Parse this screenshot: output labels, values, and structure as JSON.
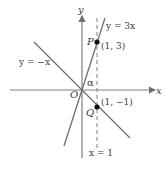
{
  "diagram": {
    "axes": {
      "x_label": "x",
      "y_label": "y",
      "origin_label": "O"
    },
    "lines": [
      {
        "name": "y=3x",
        "label": "y = 3x"
      },
      {
        "name": "y=-x",
        "label": "y = −x"
      },
      {
        "name": "x=1",
        "label": "x = 1",
        "style": "dashed"
      }
    ],
    "points": [
      {
        "name": "P",
        "label": "P",
        "coords": "(1, 3)"
      },
      {
        "name": "Q",
        "label": "Q",
        "coords": "(1, −1)"
      }
    ],
    "angle_label": "α",
    "colors": {
      "line": "#707070",
      "axis": "#808080",
      "point": "#111111",
      "text": "#3a3a3a"
    }
  }
}
